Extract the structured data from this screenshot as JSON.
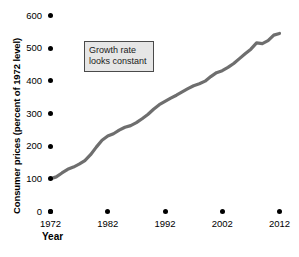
{
  "chart_data": {
    "type": "line",
    "title": "",
    "xlabel": "Year",
    "ylabel": "Consumer prices (percent of 1972 level)",
    "xlim": [
      1972,
      2012
    ],
    "ylim": [
      0,
      600
    ],
    "grid": false,
    "legend": "none",
    "line_color": "#6e6e6e",
    "x_ticks": [
      "1972",
      "1982",
      "1992",
      "2002",
      "2012"
    ],
    "x_tick_values": [
      1972,
      1982,
      1992,
      2002,
      2012
    ],
    "y_ticks": [
      "0",
      "100",
      "200",
      "300",
      "400",
      "500",
      "600"
    ],
    "y_tick_values": [
      0,
      100,
      200,
      300,
      400,
      500,
      600
    ],
    "series": [
      {
        "name": "Consumer prices (percent of 1972 level)",
        "x": [
          1972,
          1973,
          1974,
          1975,
          1976,
          1977,
          1978,
          1979,
          1980,
          1981,
          1982,
          1983,
          1984,
          1985,
          1986,
          1987,
          1988,
          1989,
          1990,
          1991,
          1992,
          1993,
          1994,
          1995,
          1996,
          1997,
          1998,
          1999,
          2000,
          2001,
          2002,
          2003,
          2004,
          2005,
          2006,
          2007,
          2008,
          2009,
          2010,
          2011,
          2012
        ],
        "values": [
          100,
          106,
          118,
          129,
          136,
          145,
          156,
          174,
          197,
          218,
          231,
          238,
          249,
          258,
          263,
          272,
          284,
          297,
          313,
          327,
          337,
          347,
          356,
          366,
          376,
          385,
          391,
          399,
          413,
          425,
          431,
          441,
          453,
          468,
          483,
          497,
          516,
          514,
          523,
          540,
          545
        ]
      }
    ],
    "annotations": [
      {
        "name": "growth-rate-note",
        "line1": "Growth rate",
        "line2": "looks constant",
        "x": 1980,
        "y": 505
      }
    ]
  }
}
